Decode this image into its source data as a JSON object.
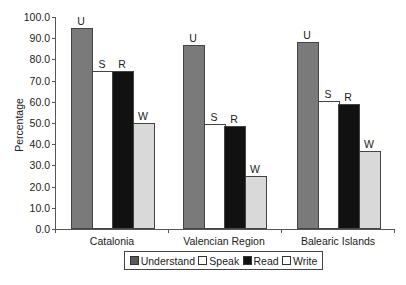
{
  "chart_data": {
    "type": "bar",
    "title": "",
    "xlabel": "",
    "ylabel": "Percentage",
    "ylim": [
      0,
      100
    ],
    "yticks": [
      "0.0",
      "10.0",
      "20.0",
      "30.0",
      "40.0",
      "50.0",
      "60.0",
      "70.0",
      "80.0",
      "90.0",
      "100.0"
    ],
    "grid": false,
    "legend_position": "bottom",
    "categories": [
      "Catalonia",
      "Valencian Region",
      "Balearic Islands"
    ],
    "series": [
      {
        "name": "Understand",
        "short": "U",
        "color": "#7a7a7a",
        "values": [
          95.0,
          87.0,
          88.0
        ]
      },
      {
        "name": "Speak",
        "short": "S",
        "color": "#ffffff",
        "values": [
          74.5,
          49.5,
          60.3
        ]
      },
      {
        "name": "Read",
        "short": "R",
        "color": "#111111",
        "values": [
          74.3,
          48.7,
          59.0
        ]
      },
      {
        "name": "Write",
        "short": "W",
        "color": "#d9d9d9",
        "values": [
          50.0,
          25.0,
          36.8
        ]
      }
    ]
  },
  "legend": {
    "items": [
      {
        "label": "Understand",
        "color": "#5a5a5a"
      },
      {
        "label": "Speak",
        "color": "#ffffff"
      },
      {
        "label": "Read",
        "color": "#111111"
      },
      {
        "label": "Write",
        "color": "#ffffff"
      }
    ]
  }
}
